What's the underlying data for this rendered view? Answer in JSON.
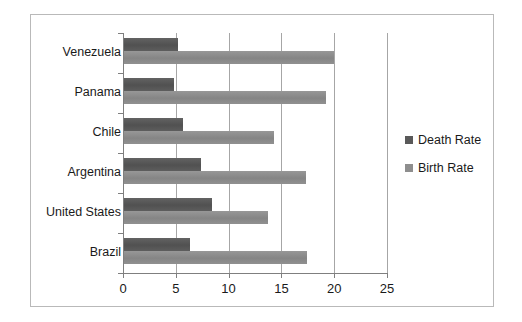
{
  "chart_data": {
    "type": "bar",
    "orientation": "horizontal",
    "title": "",
    "xlabel": "",
    "ylabel": "",
    "categories": [
      "Brazil",
      "United States",
      "Argentina",
      "Chile",
      "Panama",
      "Venezuela"
    ],
    "series": [
      {
        "name": "Death Rate",
        "color": "#595959",
        "values": [
          6.3,
          8.4,
          7.4,
          5.7,
          4.8,
          5.2
        ]
      },
      {
        "name": "Birth Rate",
        "color": "#8e8e8e",
        "values": [
          17.4,
          13.7,
          17.3,
          14.3,
          19.2,
          20.0
        ]
      }
    ],
    "xlim": [
      0,
      25
    ],
    "xticks": [
      0,
      5,
      10,
      15,
      20,
      25
    ],
    "xtick_labels": [
      "0",
      "5",
      "10",
      "15",
      "20",
      "25"
    ],
    "grid": true,
    "grid_axis": "x",
    "legend_position": "right",
    "legend_entries": [
      "Death Rate",
      "Birth Rate"
    ]
  },
  "frame": {
    "border_color": "#b9b9b9",
    "background": "#ffffff"
  }
}
